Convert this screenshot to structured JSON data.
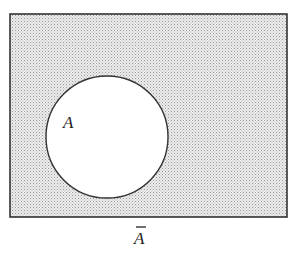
{
  "diagram": {
    "type": "venn",
    "universe": {
      "shaded": true,
      "fill": "#d9d9d9",
      "stroke": "#333333"
    },
    "sets": [
      {
        "label": "A",
        "shaded": false,
        "fill": "#ffffff"
      }
    ],
    "complement_label": "A",
    "complement_overbar": true
  }
}
